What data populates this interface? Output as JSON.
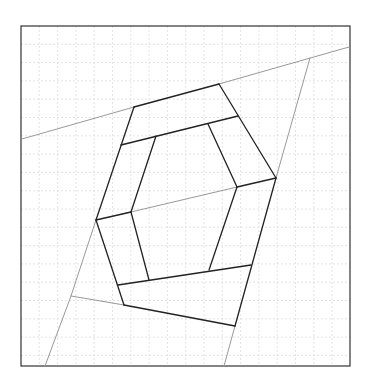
{
  "diagram": {
    "type": "geometric-line-figure",
    "canvas": {
      "width": 370,
      "height": 390
    },
    "frame": {
      "x": 21,
      "y": 26,
      "width": 329,
      "height": 340,
      "stroke": "#333333",
      "stroke_width": 1.2
    },
    "grid": {
      "spacing": 18.3,
      "stroke": "#dcdcdc",
      "dash": "2,2"
    },
    "colors": {
      "dark_line": "#222222",
      "gray_line": "#999999"
    },
    "gray_lines": [
      {
        "id": "top-left-extension",
        "points": [
          [
            22,
            139
          ],
          [
            134,
            107
          ]
        ]
      },
      {
        "id": "top-right-extension",
        "points": [
          [
            219,
            84
          ],
          [
            349,
            47
          ]
        ]
      },
      {
        "id": "right-diagonal",
        "points": [
          [
            310,
            58
          ],
          [
            276,
            178
          ]
        ]
      },
      {
        "id": "right-lower-extension",
        "points": [
          [
            235,
            326
          ],
          [
            224,
            366
          ]
        ]
      },
      {
        "id": "left-diagonal",
        "points": [
          [
            96,
            220
          ],
          [
            71,
            296
          ],
          [
            45,
            366
          ]
        ]
      },
      {
        "id": "bottom-left-extension",
        "points": [
          [
            71,
            296
          ],
          [
            124,
            305
          ]
        ]
      },
      {
        "id": "inner-middle",
        "points": [
          [
            131,
            212
          ],
          [
            237,
            187
          ]
        ]
      }
    ],
    "dark_lines": [
      {
        "id": "outer-top",
        "points": [
          [
            134,
            107
          ],
          [
            219,
            84
          ]
        ]
      },
      {
        "id": "outer-top-right",
        "points": [
          [
            219,
            84
          ],
          [
            276,
            178
          ]
        ]
      },
      {
        "id": "outer-right",
        "points": [
          [
            276,
            178
          ],
          [
            235,
            326
          ]
        ]
      },
      {
        "id": "outer-bottom",
        "points": [
          [
            235,
            326
          ],
          [
            124,
            305
          ]
        ]
      },
      {
        "id": "outer-bottom-left",
        "points": [
          [
            124,
            305
          ],
          [
            96,
            220
          ]
        ]
      },
      {
        "id": "outer-left",
        "points": [
          [
            96,
            220
          ],
          [
            134,
            107
          ]
        ]
      },
      {
        "id": "inner-top-band",
        "points": [
          [
            121,
            145
          ],
          [
            238,
            116
          ]
        ]
      },
      {
        "id": "inner-top-left",
        "points": [
          [
            156,
            136
          ],
          [
            131,
            212
          ]
        ]
      },
      {
        "id": "inner-top-right",
        "points": [
          [
            208,
            124
          ],
          [
            237,
            187
          ]
        ]
      },
      {
        "id": "inner-right-edge",
        "points": [
          [
            237,
            187
          ],
          [
            276,
            178
          ]
        ]
      },
      {
        "id": "inner-right-lower",
        "points": [
          [
            237,
            187
          ],
          [
            209,
            270
          ]
        ]
      },
      {
        "id": "inner-left-lower",
        "points": [
          [
            131,
            212
          ],
          [
            149,
            280
          ]
        ]
      },
      {
        "id": "inner-bottom-band",
        "points": [
          [
            118,
            285
          ],
          [
            251,
            265
          ]
        ]
      },
      {
        "id": "inner-left-edge",
        "points": [
          [
            96,
            220
          ],
          [
            131,
            212
          ]
        ]
      }
    ]
  }
}
